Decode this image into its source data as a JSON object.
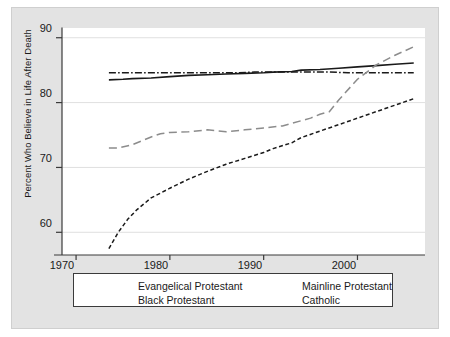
{
  "chart_data": {
    "type": "line",
    "title": "",
    "xlabel": "",
    "ylabel": "Percent Who Believe in Life After Death",
    "xlim": [
      1968.5,
      2007.2
    ],
    "ylim": [
      56.5,
      91.5
    ],
    "xticks": [
      1970,
      1980,
      1990,
      2000
    ],
    "yticks": [
      60,
      70,
      80,
      90
    ],
    "grid": "horizontal",
    "legend_position": "below-axes",
    "series": [
      {
        "name": "Evangelical Protestant",
        "style": "solid",
        "color": "#1a1a1a",
        "x": [
          1973.5,
          1975,
          1976,
          1978,
          1980,
          1982,
          1984,
          1986,
          1988,
          1990,
          1991,
          1993,
          1994,
          1996,
          1998,
          2000,
          2002,
          2004,
          2006
        ],
        "y": [
          83.5,
          83.6,
          83.7,
          83.8,
          84.0,
          84.2,
          84.3,
          84.4,
          84.5,
          84.6,
          84.7,
          84.8,
          85.0,
          85.1,
          85.3,
          85.5,
          85.7,
          85.9,
          86.1
        ]
      },
      {
        "name": "Black Protestant",
        "style": "dashed",
        "color": "#1a1a1a",
        "x": [
          1973.5,
          1974.5,
          1975.5,
          1976.5,
          1978,
          1980,
          1982,
          1984,
          1986,
          1988,
          1990,
          1991,
          1993,
          1994,
          1996,
          1998,
          2000,
          2002,
          2004,
          2006
        ],
        "y": [
          57.5,
          60.0,
          62.0,
          63.5,
          65.3,
          66.8,
          68.2,
          69.4,
          70.5,
          71.4,
          72.3,
          72.9,
          73.8,
          74.6,
          75.6,
          76.6,
          77.6,
          78.6,
          79.6,
          80.6
        ]
      },
      {
        "name": "Mainline Protestant",
        "style": "dashdot",
        "color": "#1a1a1a",
        "x": [
          1973.5,
          1975,
          1977,
          1979,
          1981,
          1983,
          1985,
          1987,
          1989,
          1991,
          1993,
          1995,
          1997,
          1999,
          2001,
          2003,
          2005,
          2006
        ],
        "y": [
          84.6,
          84.6,
          84.6,
          84.6,
          84.6,
          84.6,
          84.6,
          84.6,
          84.7,
          84.7,
          84.7,
          84.7,
          84.7,
          84.6,
          84.6,
          84.6,
          84.6,
          84.6
        ]
      },
      {
        "name": "Catholic",
        "style": "longdash",
        "color": "#8c8c8c",
        "x": [
          1973.5,
          1974.5,
          1976,
          1977,
          1978,
          1979,
          1980,
          1982,
          1984,
          1986,
          1988,
          1990,
          1992,
          1993,
          1994,
          1995,
          1996,
          1997,
          1998,
          2000,
          2002,
          2004,
          2006
        ],
        "y": [
          73.0,
          73.0,
          73.5,
          74.1,
          74.7,
          75.2,
          75.4,
          75.5,
          75.8,
          75.5,
          75.8,
          76.1,
          76.4,
          76.8,
          77.2,
          77.6,
          78.2,
          78.6,
          80.4,
          83.6,
          85.8,
          87.3,
          88.6
        ]
      }
    ]
  },
  "axis": {
    "ytick_labels": [
      "90",
      "80",
      "70",
      "60"
    ],
    "xtick_labels": [
      "1970",
      "1980",
      "1990",
      "2000"
    ],
    "ylabel_text": "Percent Who Believe in Life After Death"
  },
  "legend": {
    "entries": [
      {
        "label": "Evangelical Protestant",
        "style": "solid"
      },
      {
        "label": "Black Protestant",
        "style": "dashed"
      },
      {
        "label": "Mainline Protestant",
        "style": "dashdot"
      },
      {
        "label": "Catholic",
        "style": "longdash"
      }
    ]
  }
}
